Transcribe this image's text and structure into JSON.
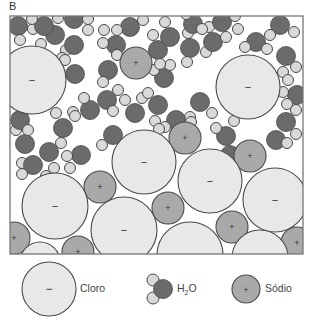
{
  "panel_label": "B",
  "colors": {
    "cloro_fill": "#e8e8e8",
    "sodio_fill": "#a9a9a9",
    "oxygen_fill": "#6b6b6b",
    "hydrogen_fill": "#d9d9d9",
    "stroke": "#4a4a4a",
    "frame": "#777777"
  },
  "frame": {
    "x": 10,
    "y": 16,
    "w": 293,
    "h": 238
  },
  "ions": {
    "cloro": [
      {
        "cx": 32,
        "cy": 80,
        "r": 34
      },
      {
        "cx": 248,
        "cy": 87,
        "r": 32
      },
      {
        "cx": 55,
        "cy": 206,
        "r": 33
      },
      {
        "cx": 124,
        "cy": 230,
        "r": 33
      },
      {
        "cx": 210,
        "cy": 181,
        "r": 32
      },
      {
        "cx": 275,
        "cy": 200,
        "r": 32
      },
      {
        "cx": 144,
        "cy": 162,
        "r": 32
      },
      {
        "cx": 190,
        "cy": 255,
        "r": 33
      },
      {
        "cx": 260,
        "cy": 258,
        "r": 28
      },
      {
        "cx": 40,
        "cy": 262,
        "r": 20
      }
    ],
    "sodio": [
      {
        "cx": 136,
        "cy": 63,
        "r": 16
      },
      {
        "cx": 185,
        "cy": 138,
        "r": 16
      },
      {
        "cx": 100,
        "cy": 187,
        "r": 16
      },
      {
        "cx": 250,
        "cy": 156,
        "r": 16
      },
      {
        "cx": 168,
        "cy": 208,
        "r": 16
      },
      {
        "cx": 232,
        "cy": 227,
        "r": 16
      },
      {
        "cx": 14,
        "cy": 238,
        "r": 16
      },
      {
        "cx": 78,
        "cy": 252,
        "r": 16
      },
      {
        "cx": 297,
        "cy": 243,
        "r": 16
      }
    ]
  },
  "water": [
    {
      "ox": 18,
      "oy": 26,
      "h": [
        [
          33,
          29
        ],
        [
          20,
          40
        ]
      ]
    },
    {
      "ox": 55,
      "oy": 35,
      "h": [
        [
          41,
          44
        ],
        [
          66,
          50
        ]
      ]
    },
    {
      "ox": 74,
      "oy": 45,
      "h": [
        [
          88,
          30
        ],
        [
          62,
          58
        ]
      ]
    },
    {
      "ox": 75,
      "oy": 74,
      "h": [
        [
          65,
          60
        ],
        [
          60,
          81
        ]
      ]
    },
    {
      "ox": 44,
      "oy": 26,
      "h": [
        [
          32,
          19
        ],
        [
          58,
          18
        ]
      ]
    },
    {
      "ox": 74,
      "oy": 19,
      "h": [
        [
          88,
          19
        ],
        [
          61,
          9
        ]
      ]
    },
    {
      "ox": 116,
      "oy": 45,
      "h": [
        [
          104,
          30
        ],
        [
          103,
          43
        ]
      ]
    },
    {
      "ox": 130,
      "oy": 27,
      "h": [
        [
          117,
          30
        ],
        [
          143,
          20
        ]
      ]
    },
    {
      "ox": 108,
      "oy": 70,
      "h": [
        [
          117,
          55
        ],
        [
          103,
          82
        ]
      ]
    },
    {
      "ox": 90,
      "oy": 110,
      "h": [
        [
          73,
          112
        ],
        [
          84,
          98
        ]
      ]
    },
    {
      "ox": 107,
      "oy": 100,
      "h": [
        [
          118,
          90
        ],
        [
          113,
          111
        ]
      ]
    },
    {
      "ox": 135,
      "oy": 113,
      "h": [
        [
          125,
          100
        ],
        [
          142,
          98
        ]
      ]
    },
    {
      "ox": 158,
      "oy": 105,
      "h": [
        [
          148,
          93
        ],
        [
          155,
          121
        ]
      ]
    },
    {
      "ox": 164,
      "oy": 78,
      "h": [
        [
          154,
          70
        ],
        [
          170,
          65
        ]
      ]
    },
    {
      "ox": 158,
      "oy": 50,
      "h": [
        [
          160,
          64
        ],
        [
          153,
          35
        ]
      ]
    },
    {
      "ox": 170,
      "oy": 37,
      "h": [
        [
          188,
          33
        ],
        [
          165,
          22
        ]
      ]
    },
    {
      "ox": 190,
      "oy": 48,
      "h": [
        [
          206,
          52
        ],
        [
          187,
          62
        ]
      ]
    },
    {
      "ox": 193,
      "oy": 24,
      "h": [
        [
          209,
          27
        ],
        [
          186,
          14
        ]
      ]
    },
    {
      "ox": 213,
      "oy": 42,
      "h": [
        [
          202,
          29
        ],
        [
          226,
          37
        ]
      ]
    },
    {
      "ox": 222,
      "oy": 22,
      "h": [
        [
          238,
          29
        ],
        [
          235,
          16
        ]
      ]
    },
    {
      "ox": 256,
      "oy": 42,
      "h": [
        [
          267,
          49
        ],
        [
          245,
          47
        ]
      ]
    },
    {
      "ox": 280,
      "oy": 25,
      "h": [
        [
          270,
          35
        ],
        [
          294,
          32
        ]
      ]
    },
    {
      "ox": 286,
      "oy": 56,
      "h": [
        [
          283,
          72
        ],
        [
          296,
          67
        ]
      ]
    },
    {
      "ox": 297,
      "oy": 95,
      "h": [
        [
          283,
          92
        ],
        [
          288,
          80
        ]
      ]
    },
    {
      "ox": 286,
      "oy": 122,
      "h": [
        [
          287,
          104
        ],
        [
          296,
          110
        ]
      ]
    },
    {
      "ox": 276,
      "oy": 140,
      "h": [
        [
          287,
          143
        ],
        [
          296,
          134
        ]
      ]
    },
    {
      "ox": 226,
      "oy": 136,
      "h": [
        [
          216,
          128
        ],
        [
          234,
          121
        ]
      ]
    },
    {
      "ox": 230,
      "oy": 155,
      "h": [
        [
          220,
          165
        ],
        [
          230,
          172
        ]
      ]
    },
    {
      "ox": 200,
      "oy": 102,
      "h": [
        [
          212,
          113
        ],
        [
          190,
          117
        ]
      ]
    },
    {
      "ox": 176,
      "oy": 120,
      "h": [
        [
          165,
          127
        ],
        [
          191,
          122
        ]
      ]
    },
    {
      "ox": 147,
      "oy": 140,
      "h": [
        [
          159,
          129
        ],
        [
          138,
          155
        ]
      ]
    },
    {
      "ox": 113,
      "oy": 135,
      "h": [
        [
          102,
          145
        ],
        [
          126,
          147
        ]
      ]
    },
    {
      "ox": 81,
      "oy": 155,
      "h": [
        [
          70,
          168
        ],
        [
          67,
          156
        ]
      ]
    },
    {
      "ox": 49,
      "oy": 152,
      "h": [
        [
          61,
          143
        ],
        [
          54,
          168
        ]
      ]
    },
    {
      "ox": 25,
      "oy": 144,
      "h": [
        [
          22,
          163
        ],
        [
          16,
          130
        ]
      ]
    },
    {
      "ox": 20,
      "oy": 120,
      "h": [
        [
          28,
          130
        ],
        [
          24,
          108
        ]
      ]
    },
    {
      "ox": 63,
      "oy": 128,
      "h": [
        [
          75,
          116
        ],
        [
          56,
          113
        ]
      ]
    },
    {
      "ox": 33,
      "oy": 165,
      "h": [
        [
          22,
          174
        ],
        [
          46,
          176
        ]
      ]
    }
  ],
  "legend": {
    "cloro": {
      "label": "Cloro",
      "sign": "−"
    },
    "water": {
      "label_main": "H",
      "label_sub": "2",
      "label_end": "O"
    },
    "sodio": {
      "label": "Sódio",
      "sign": "+"
    }
  }
}
